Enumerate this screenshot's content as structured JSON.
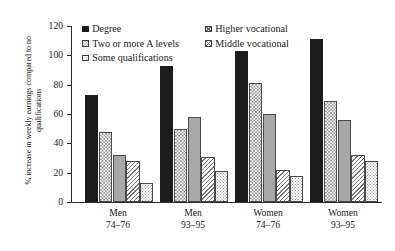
{
  "chart_data": {
    "type": "bar",
    "title": "",
    "xlabel": "",
    "ylabel": "% increase in weekly earnings compared to no qualifications",
    "ylim": [
      0,
      120
    ],
    "ytick_labels": [
      "120",
      "100",
      "80",
      "60",
      "40",
      "20",
      "0"
    ],
    "ytick_values": [
      120,
      100,
      80,
      60,
      40,
      20,
      0
    ],
    "grid": false,
    "legend_position": "top-inside",
    "categories": [
      {
        "line1": "Men",
        "line2": "74–76"
      },
      {
        "line1": "Men",
        "line2": "93–95"
      },
      {
        "line1": "Women",
        "line2": "74–76"
      },
      {
        "line1": "Women",
        "line2": "93–95"
      }
    ],
    "category_labels": [
      "Men 74–76",
      "Men 93–95",
      "Women 74–76",
      "Women 93–95"
    ],
    "series": [
      {
        "name": "Degree",
        "fill": "solid-black",
        "color": "#1b1b1b",
        "values": [
          73,
          93,
          103,
          111
        ]
      },
      {
        "name": "Two or more A levels",
        "fill": "checkerboard",
        "color": "#8f8f8f",
        "values": [
          48,
          50,
          81,
          69
        ]
      },
      {
        "name": "Higher vocational",
        "fill": "solid-gray",
        "color": "#a8a8a8",
        "values": [
          32,
          58,
          60,
          56
        ]
      },
      {
        "name": "Middle vocational",
        "fill": "diagonal-hatch",
        "color": "#777777",
        "values": [
          28,
          31,
          22,
          32
        ]
      },
      {
        "name": "Some qualifications",
        "fill": "dotted",
        "color": "#9a9a9a",
        "values": [
          13,
          21,
          18,
          28
        ]
      }
    ]
  },
  "legend": {
    "columns": [
      {
        "items": [
          {
            "label": "Degree",
            "swatch": "solid-black-swatch"
          },
          {
            "label": "Two or more A levels",
            "swatch": "checkerboard-swatch"
          },
          {
            "label": "Some qualifications",
            "swatch": "dotted-swatch"
          }
        ]
      },
      {
        "items": [
          {
            "label": "Higher vocational",
            "swatch": "crosshatch-swatch"
          },
          {
            "label": "Middle vocational",
            "swatch": "crosshatch-swatch"
          }
        ]
      }
    ]
  }
}
